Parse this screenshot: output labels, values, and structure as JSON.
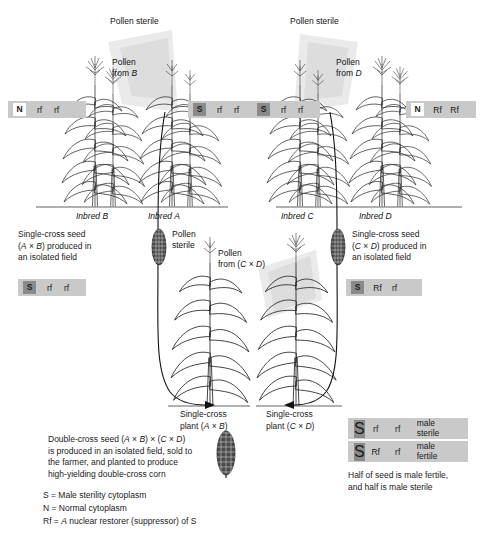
{
  "figure": {
    "type": "diagram"
  },
  "top_left_field": {
    "pollen_sterile_label": "Pollen sterile",
    "pollen_source_label": "Pollen\nfrom B",
    "left_plant_label": "Inbred B",
    "right_plant_label": "Inbred A",
    "left_genotype": {
      "cytoplasm": "N",
      "allele1": "rf",
      "allele2": "rf"
    },
    "right_genotype": {
      "cytoplasm": "S",
      "allele1": "rf",
      "allele2": "rf"
    },
    "seed_caption": "Single-cross seed\n(A × B) produced in\nan isolated field"
  },
  "top_right_field": {
    "pollen_sterile_label": "Pollen sterile",
    "pollen_source_label": "Pollen\nfrom D",
    "left_plant_label": "Inbred C",
    "right_plant_label": "Inbred D",
    "left_genotype": {
      "cytoplasm": "S",
      "allele1": "rf",
      "allele2": "rf"
    },
    "right_genotype": {
      "cytoplasm": "N",
      "allele1": "Rf",
      "allele2": "Rf"
    },
    "seed_caption": "Single-cross seed\n(C × D) produced in\nan isolated field"
  },
  "middle_field": {
    "pollen_sterile_label": "Pollen\nsterile",
    "pollen_source_label": "Pollen\nfrom (C × D)",
    "left_plant_label": "Single-cross\nplant (A × B)",
    "right_plant_label": "Single-cross\nplant (C × D)",
    "left_genotype": {
      "cytoplasm": "S",
      "allele1": "rf",
      "allele2": "rf"
    },
    "right_genotype": {
      "cytoplasm": "S",
      "allele1": "Rf",
      "allele2": "rf"
    }
  },
  "double_cross_note": "Double-cross seed (A × B) × (C × D)\nis produced in an isolated field, sold to\nthe farmer, and planted to produce\nhigh-yielding double-cross corn",
  "legend": {
    "lines": [
      "S = Male sterility cytoplasm",
      "N = Normal cytoplasm",
      "Rf = A nuclear restorer (suppressor) of S"
    ]
  },
  "outcome_key": {
    "rows": [
      {
        "cytoplasm": "S",
        "allele1": "rf",
        "allele2": "rf",
        "phenotype": "male\nsterile"
      },
      {
        "cytoplasm": "S",
        "allele1": "Rf",
        "allele2": "rf",
        "phenotype": "male\nfertile"
      }
    ],
    "note": "Half of seed is male fertile,\nand half is male sterile"
  },
  "colors": {
    "box_background": "#c9c9c9",
    "sterile_cytoplasm": "#8a8a8a",
    "normal_cytoplasm": "#ffffff",
    "ink": "#1a1a1a",
    "pollen_cloud": "#d9d9d9"
  }
}
